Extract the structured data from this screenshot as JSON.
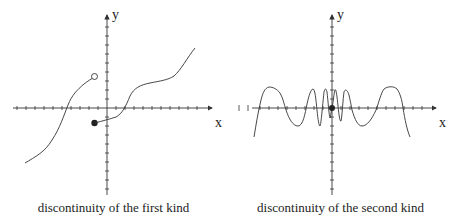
{
  "panels": [
    {
      "id": "first-kind",
      "caption": "discontinuity of the first kind",
      "x_label": "x",
      "y_label": "y",
      "discontinuity": {
        "open_point": "left limit (hollow circle)",
        "closed_point": "function value (filled dot)"
      }
    },
    {
      "id": "second-kind",
      "caption": "discontinuity of the second kind",
      "x_label": "x",
      "y_label": "y",
      "discontinuity": {
        "closed_point": "filled dot at origin; oscillation grows infinitely fast near x=0"
      }
    }
  ],
  "colors": {
    "ink": "#333333",
    "background": "#ffffff"
  }
}
